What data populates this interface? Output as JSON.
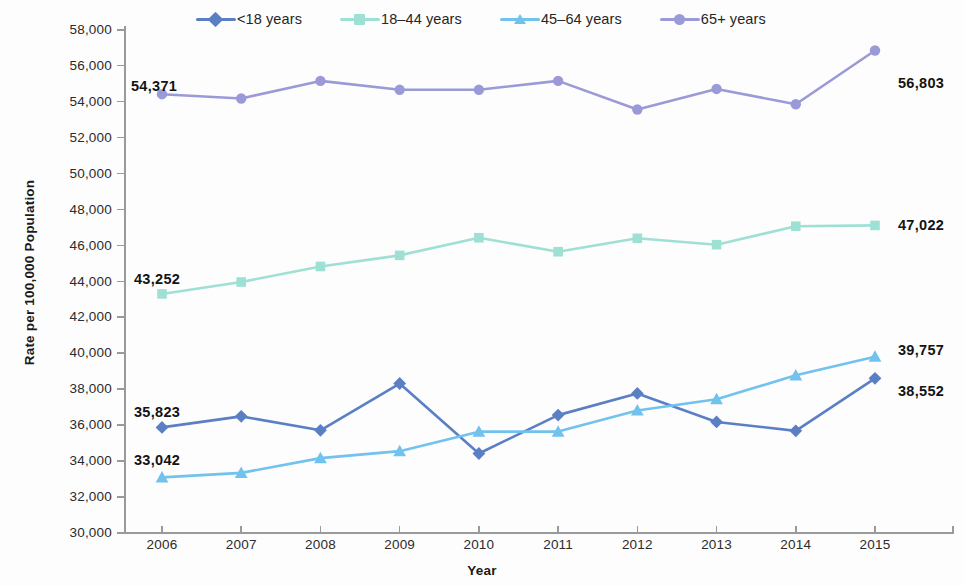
{
  "chart_data": {
    "type": "line",
    "title": "",
    "xlabel": "Year",
    "ylabel": "Rate per 100,000 Population",
    "categories": [
      "2006",
      "2007",
      "2008",
      "2009",
      "2010",
      "2011",
      "2012",
      "2013",
      "2014",
      "2015"
    ],
    "x": [
      2006,
      2007,
      2008,
      2009,
      2010,
      2011,
      2012,
      2013,
      2014,
      2015
    ],
    "ylim": [
      30000,
      58000
    ],
    "ytick_interval": 2000,
    "ytick_labels": [
      "58,000",
      "56,000",
      "54,000",
      "52,000",
      "50,000",
      "48,000",
      "46,000",
      "44,000",
      "42,000",
      "40,000",
      "38,000",
      "36,000",
      "34,000",
      "32,000",
      "30,000"
    ],
    "ytick_values": [
      58000,
      56000,
      54000,
      52000,
      50000,
      48000,
      46000,
      44000,
      42000,
      40000,
      38000,
      36000,
      34000,
      32000,
      30000
    ],
    "grid": false,
    "legend_position": "top",
    "series": [
      {
        "name": "<18 years",
        "color": "#5b7fc4",
        "marker": "diamond",
        "values": [
          35823,
          36437,
          35659,
          38266,
          34371,
          36506,
          37715,
          36125,
          35631,
          38552
        ],
        "start_label": "35,823",
        "end_label": "38,552"
      },
      {
        "name": "18–44 years",
        "color": "#9fe0d4",
        "marker": "square",
        "values": [
          43252,
          43915,
          44781,
          45399,
          46379,
          45603,
          46349,
          45993,
          47022,
          47066
        ],
        "start_label": "43,252",
        "end_label": "47,022"
      },
      {
        "name": "45–64 years",
        "color": "#72c2ee",
        "marker": "triangle",
        "values": [
          33042,
          33290,
          34112,
          34500,
          35585,
          35589,
          36766,
          37392,
          38720,
          39757
        ],
        "start_label": "33,042",
        "end_label": "39,757"
      },
      {
        "name": "65+ years",
        "color": "#9a9ad8",
        "marker": "circle",
        "values": [
          54371,
          54132,
          55111,
          54615,
          54615,
          55111,
          53516,
          54664,
          53810,
          56803
        ],
        "start_label": "54,371",
        "end_label": "56,803"
      }
    ],
    "annotations": [
      {
        "text": "54,371",
        "series": "65+ years",
        "side": "left"
      },
      {
        "text": "56,803",
        "series": "65+ years",
        "side": "right"
      },
      {
        "text": "43,252",
        "series": "18–44 years",
        "side": "left"
      },
      {
        "text": "47,022",
        "series": "18–44 years",
        "side": "right"
      },
      {
        "text": "35,823",
        "series": "<18 years",
        "side": "left"
      },
      {
        "text": "38,552",
        "series": "<18 years",
        "side": "right"
      },
      {
        "text": "33,042",
        "series": "45–64 years",
        "side": "left"
      },
      {
        "text": "39,757",
        "series": "45–64 years",
        "side": "right"
      }
    ]
  },
  "labels": {
    "left": [
      {
        "text": "54,371",
        "x": 131,
        "y": 78
      },
      {
        "text": "43,252",
        "x": 134,
        "y": 271
      },
      {
        "text": "35,823",
        "x": 134,
        "y": 404
      },
      {
        "text": "33,042",
        "x": 134,
        "y": 452
      }
    ],
    "right": [
      {
        "text": "56,803",
        "x": 898,
        "y": 75
      },
      {
        "text": "47,022",
        "x": 898,
        "y": 217
      },
      {
        "text": "39,757",
        "x": 898,
        "y": 342
      },
      {
        "text": "38,552",
        "x": 898,
        "y": 383
      }
    ]
  }
}
